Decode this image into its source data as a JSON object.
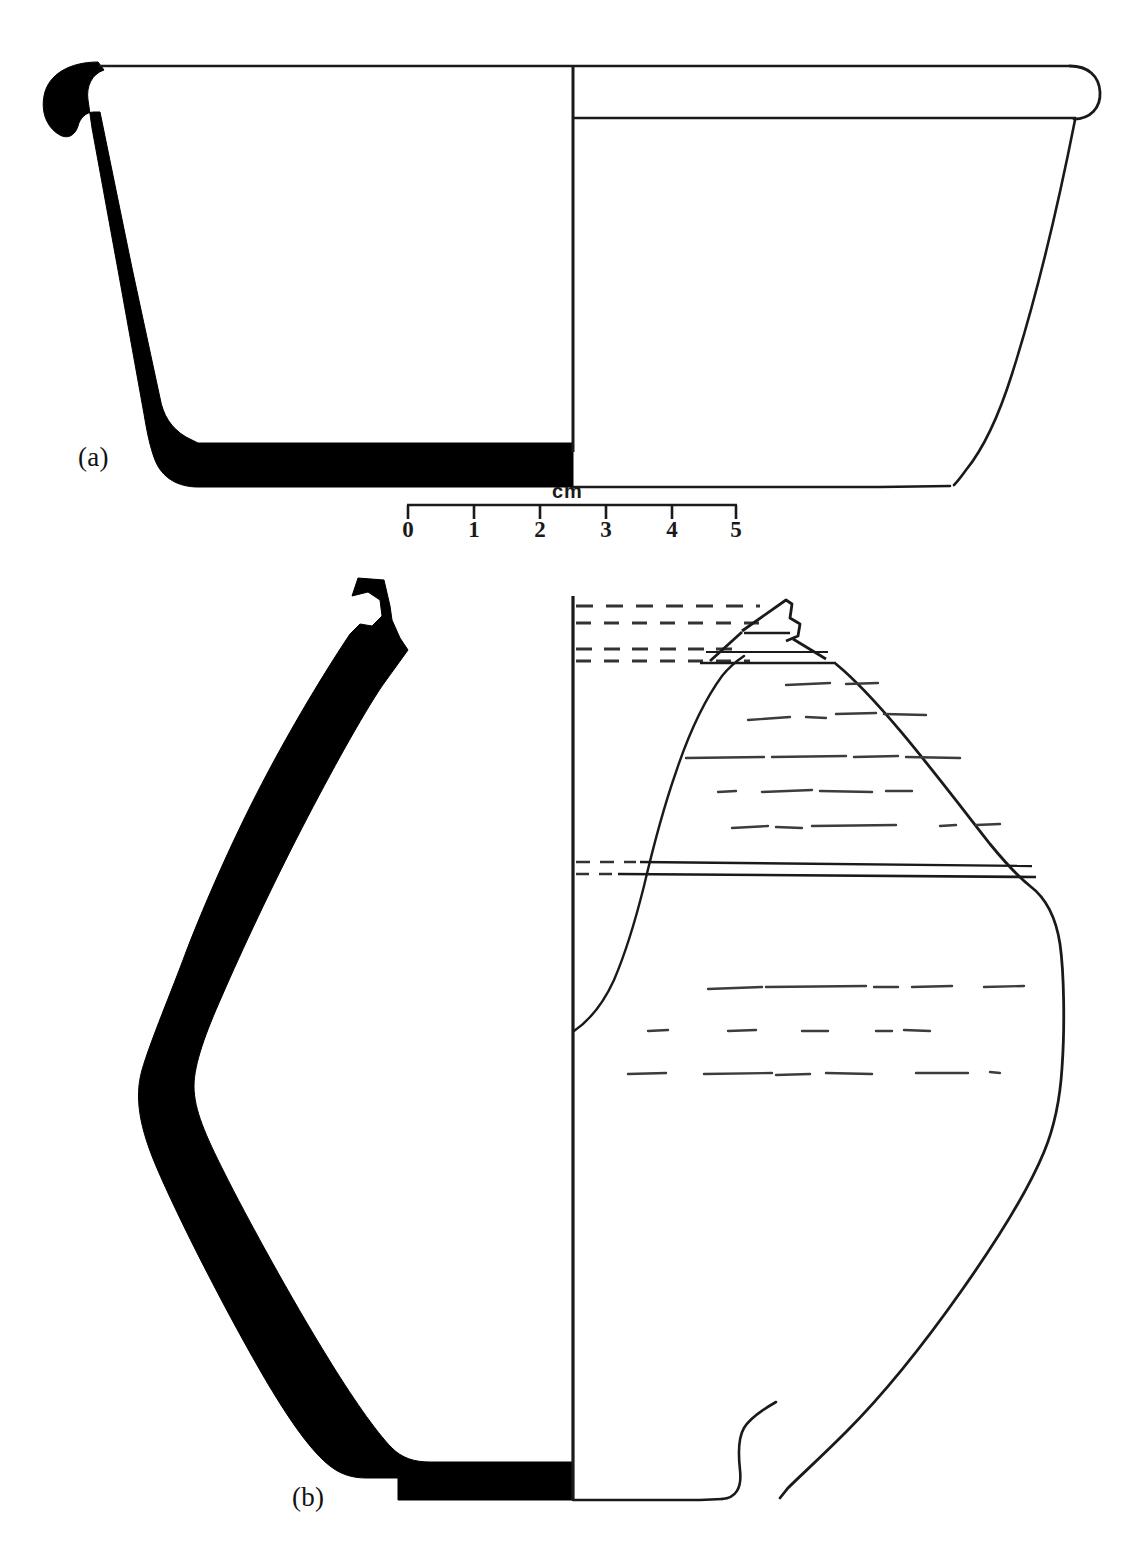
{
  "figure": {
    "type": "archaeological-pottery-profile-drawing",
    "background_color": "#ffffff",
    "ink_color": "#1a1a1a",
    "section_fill_color": "#000000",
    "panels": [
      {
        "id": "a",
        "label": "(a)",
        "description": "Straight-sided carinated bowl / beaker with flat base, half-section profile at left, exterior elevation at right"
      },
      {
        "id": "b",
        "label": "(b)",
        "description": "Large biconical jar with short everted neck and small flat base, half-section profile at left, exterior elevation at right with incised horizontal banding"
      }
    ]
  },
  "scale": {
    "unit_label": "cm",
    "ticks": [
      "0",
      "1",
      "2",
      "3",
      "4",
      "5"
    ],
    "min": 0,
    "max": 5,
    "bar_start_px": 407,
    "bar_end_px": 737,
    "px_per_unit": 66
  },
  "vessel_a": {
    "label": "(a)",
    "centerline_x": 573,
    "rim_y": 66,
    "base_y": 487,
    "rim_band_y": 118,
    "exterior_max_x": 1100,
    "base_right_x": 955
  },
  "vessel_b": {
    "label": "(b)",
    "centerline_x": 573,
    "rim_top_y": 596,
    "base_y": 1500,
    "neck_rim_y": 612,
    "collar_y": 655,
    "carination_y": 868,
    "max_diameter_y": 1085,
    "dashed_guide_lines_y": [
      606,
      622,
      648,
      660
    ],
    "decoration": "broken incised horizontal lines on shoulder and body"
  },
  "colors": {
    "ink": "#1a1a1a",
    "solid_section": "#000000",
    "paper": "#ffffff",
    "faint_line": "#4a4a4a"
  }
}
